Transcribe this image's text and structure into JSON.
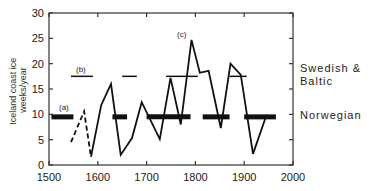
{
  "chart_data": {
    "type": "line",
    "title": "",
    "xlabel": "",
    "ylabel": "Iceland coast ice weeks/year",
    "xlim": [
      1500,
      2000
    ],
    "ylim": [
      0,
      30
    ],
    "xticks": [
      1500,
      1600,
      1700,
      1800,
      1900,
      2000
    ],
    "yticks": [
      0,
      5,
      10,
      15,
      20,
      25,
      30
    ],
    "grid": false,
    "series": [
      {
        "name": "Iceland coast ice (early, dashed)",
        "style": "dashed",
        "x": [
          1545,
          1572,
          1586
        ],
        "y": [
          4.5,
          10.6,
          1.6
        ]
      },
      {
        "name": "Iceland coast ice",
        "style": "solid",
        "x": [
          1586,
          1607,
          1627,
          1647,
          1670,
          1690,
          1727,
          1749,
          1770,
          1792,
          1809,
          1827,
          1852,
          1872,
          1893,
          1918,
          1946
        ],
        "y": [
          1.6,
          11.8,
          16,
          2,
          5.3,
          12.4,
          5.1,
          17.2,
          8,
          24.7,
          18.2,
          18.6,
          7.3,
          20,
          17.8,
          2.2,
          9.9
        ]
      },
      {
        "name": "Swedish & Baltic",
        "style": "thin-horizontal-segments",
        "level": 17.5,
        "segments": [
          [
            1545,
            1590
          ],
          [
            1650,
            1680
          ],
          [
            1740,
            1805
          ],
          [
            1870,
            1905
          ]
        ]
      },
      {
        "name": "Norwegian",
        "style": "thick-horizontal-segments",
        "level": 9.5,
        "segments": [
          [
            1505,
            1550
          ],
          [
            1630,
            1660
          ],
          [
            1700,
            1790
          ],
          [
            1815,
            1870
          ],
          [
            1900,
            1965
          ]
        ]
      }
    ],
    "annotations": [
      {
        "text": "(a)",
        "x": 1520,
        "y": 11.5
      },
      {
        "text": "(b)",
        "x": 1575,
        "y": 19.5
      },
      {
        "text": "(c)",
        "x": 1777,
        "y": 26.3
      }
    ],
    "right_labels": [
      {
        "text_lines": [
          "Swedish &",
          "Baltic"
        ],
        "y": 17.5
      },
      {
        "text_lines": [
          "Norwegian"
        ],
        "y": 9.5
      }
    ]
  },
  "labels": {
    "ylabel_line1": "Iceland coast ice",
    "ylabel_line2": "weeks/year",
    "annot_a": "(a)",
    "annot_b": "(b)",
    "annot_c": "(c)",
    "right_swedish_1": "Swedish &",
    "right_swedish_2": "Baltic",
    "right_norwegian": "Norwegian"
  }
}
